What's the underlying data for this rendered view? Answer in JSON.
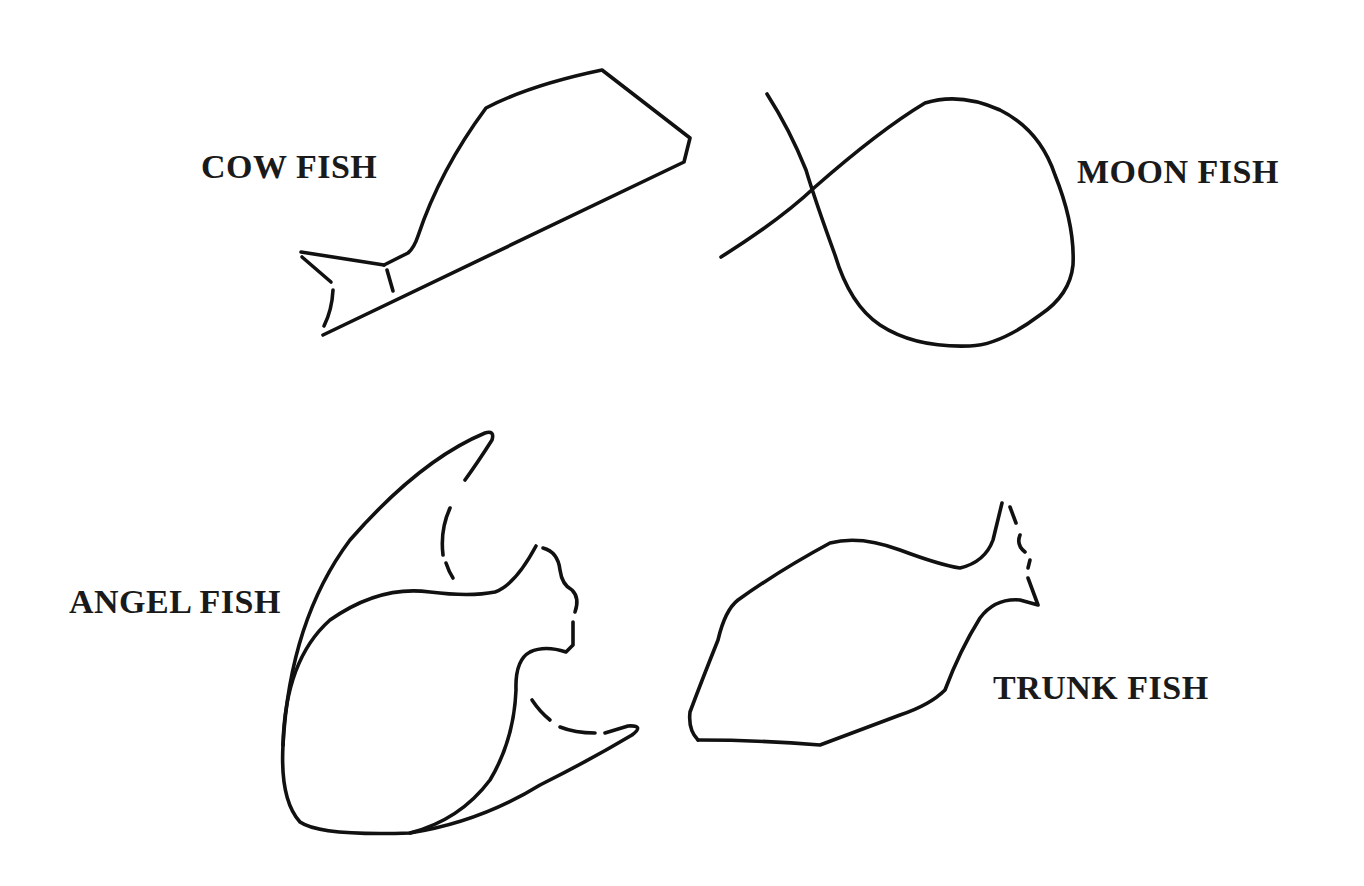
{
  "diagram": {
    "background": "#ffffff",
    "stroke_color": "#111111",
    "fish": [
      {
        "id": "cow",
        "label": "COW FISH"
      },
      {
        "id": "moon",
        "label": "MOON FISH"
      },
      {
        "id": "angel",
        "label": "ANGEL FISH"
      },
      {
        "id": "trunk",
        "label": "TRUNK FISH"
      }
    ]
  }
}
